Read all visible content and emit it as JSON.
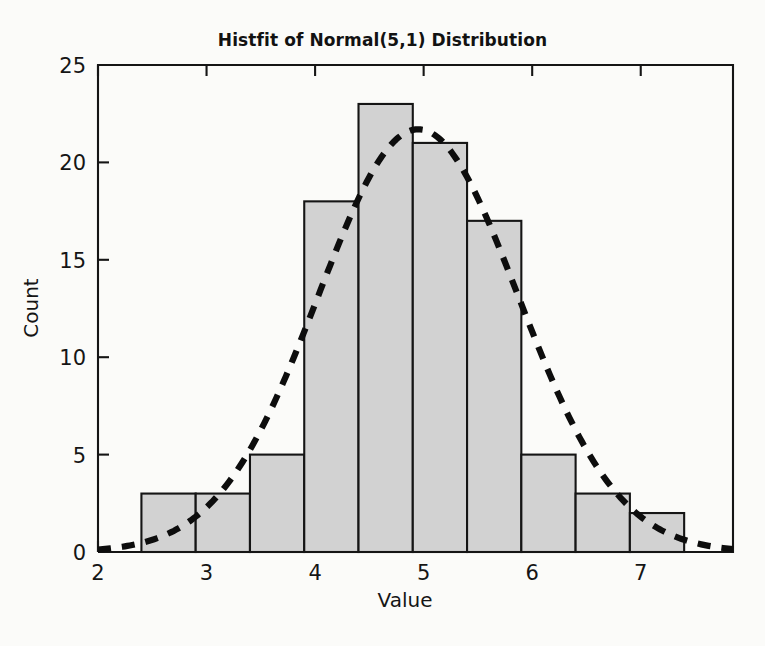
{
  "figure": {
    "background_color": "#fbfbf9",
    "ink_color": "#151515"
  },
  "chart_data": {
    "type": "bar",
    "title": "Histfit of Normal(5,1) Distribution",
    "xlabel": "Value",
    "ylabel": "Count",
    "xlim": [
      2,
      7.85
    ],
    "ylim": [
      0,
      25
    ],
    "xticks": [
      2,
      3,
      4,
      5,
      6,
      7
    ],
    "xtick_labels": [
      "2",
      "3",
      "4",
      "5",
      "6",
      "7"
    ],
    "yticks": [
      0,
      5,
      10,
      15,
      20,
      25
    ],
    "ytick_labels": [
      "0",
      "5",
      "10",
      "15",
      "20",
      "25"
    ],
    "grid": false,
    "legend": "none",
    "bar_fill_color": "#d2d2d2",
    "bar_edge_color": "#151515",
    "bin_width": 0.5,
    "bin_edges": [
      2.4,
      2.9,
      3.4,
      3.9,
      4.4,
      4.9,
      5.4,
      5.9,
      6.4,
      6.9,
      7.4
    ],
    "categories": [
      "2.4-2.9",
      "2.9-3.4",
      "3.4-3.9",
      "3.9-4.4",
      "4.4-4.9",
      "4.9-5.4",
      "5.4-5.9",
      "5.9-6.4",
      "6.4-6.9",
      "6.9-7.4"
    ],
    "bin_centers": [
      2.65,
      3.15,
      3.65,
      4.15,
      4.65,
      5.15,
      5.65,
      6.15,
      6.65,
      7.15
    ],
    "values": [
      3,
      3,
      5,
      18,
      23,
      21,
      17,
      5,
      3,
      2
    ],
    "series": [
      {
        "name": "Histogram counts",
        "values": [
          3,
          3,
          5,
          18,
          23,
          21,
          17,
          5,
          3,
          2
        ]
      },
      {
        "name": "Normal fit curve",
        "style": "dashed",
        "color": "#0d0d0d",
        "peak_value": 21.7,
        "peak_x": 4.95,
        "mean": 4.95,
        "sigma": 0.92,
        "amplitude": 21.7
      }
    ]
  }
}
